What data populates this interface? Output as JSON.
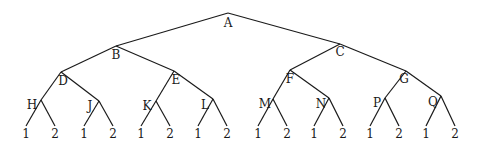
{
  "diagram": {
    "type": "binary-tree",
    "root": "A",
    "nodes": [
      {
        "id": "A",
        "label": "A",
        "x": 228,
        "y": 13,
        "lx": 228,
        "ly": 27
      },
      {
        "id": "B",
        "label": "B",
        "x": 116,
        "y": 46,
        "lx": 116,
        "ly": 59
      },
      {
        "id": "C",
        "label": "C",
        "x": 340,
        "y": 44,
        "lx": 340,
        "ly": 56
      },
      {
        "id": "D",
        "label": "D",
        "x": 61,
        "y": 72,
        "lx": 63,
        "ly": 85
      },
      {
        "id": "E",
        "label": "E",
        "x": 174,
        "y": 71,
        "lx": 176,
        "ly": 84
      },
      {
        "id": "F",
        "label": "F",
        "x": 290,
        "y": 70,
        "lx": 290,
        "ly": 83
      },
      {
        "id": "G",
        "label": "G",
        "x": 406,
        "y": 71,
        "lx": 404,
        "ly": 83
      },
      {
        "id": "H",
        "label": "H",
        "x": 41,
        "y": 100,
        "lx": 32,
        "ly": 109
      },
      {
        "id": "J",
        "label": "J",
        "x": 99,
        "y": 101,
        "lx": 90,
        "ly": 110
      },
      {
        "id": "K",
        "label": "K",
        "x": 156,
        "y": 101,
        "lx": 147,
        "ly": 110
      },
      {
        "id": "L",
        "label": "L",
        "x": 213,
        "y": 99,
        "lx": 205,
        "ly": 109
      },
      {
        "id": "M",
        "label": "M",
        "x": 273,
        "y": 99,
        "lx": 265,
        "ly": 108
      },
      {
        "id": "N",
        "label": "N",
        "x": 329,
        "y": 98,
        "lx": 321,
        "ly": 108
      },
      {
        "id": "P",
        "label": "P",
        "x": 385,
        "y": 98,
        "lx": 377,
        "ly": 107
      },
      {
        "id": "Q",
        "label": "Q",
        "x": 441,
        "y": 96,
        "lx": 433,
        "ly": 106
      }
    ],
    "edges": [
      [
        "A",
        "B"
      ],
      [
        "A",
        "C"
      ],
      [
        "B",
        "D"
      ],
      [
        "B",
        "E"
      ],
      [
        "C",
        "F"
      ],
      [
        "C",
        "G"
      ],
      [
        "D",
        "H"
      ],
      [
        "D",
        "J"
      ],
      [
        "E",
        "K"
      ],
      [
        "E",
        "L"
      ],
      [
        "F",
        "M"
      ],
      [
        "F",
        "N"
      ],
      [
        "G",
        "P"
      ],
      [
        "G",
        "Q"
      ]
    ],
    "leaf_labels": [
      "1",
      "2"
    ],
    "leaf_parents": [
      "H",
      "J",
      "K",
      "L",
      "M",
      "N",
      "P",
      "Q"
    ],
    "leaf_y": 126,
    "leaf_label_y": 138,
    "leaf_dx": [
      -15,
      14
    ]
  }
}
